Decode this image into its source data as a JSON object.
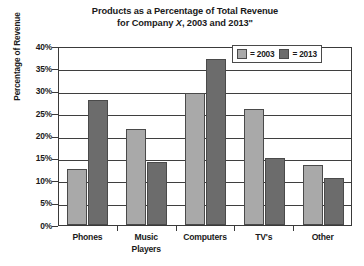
{
  "chart_data": {
    "type": "bar",
    "title": "Products as a Percentage of Total Revenue for Company X, 2003 and 2013\"",
    "title_line1": "Products as a Percentage of Total Revenue",
    "title_line2_pre": "for Company ",
    "title_line2_italic": "X",
    "title_line2_post": ", 2003 and 2013\"",
    "xlabel": "",
    "ylabel": "Percentage of Revenue",
    "ylim": [
      0,
      40
    ],
    "ytick_step": 5,
    "ytick_labels": [
      "40%",
      "35%",
      "30%",
      "25%",
      "20%",
      "15%",
      "10%",
      "5%",
      "0%"
    ],
    "ytick_values": [
      40,
      35,
      30,
      25,
      20,
      15,
      10,
      5,
      0
    ],
    "grid": true,
    "legend_position": "top-right",
    "categories": [
      "Phones",
      "Music Players",
      "Computers",
      "TV's",
      "Other"
    ],
    "category_labels": [
      {
        "line1": "Phones",
        "line2": ""
      },
      {
        "line1": "Music",
        "line2": "Players"
      },
      {
        "line1": "Computers",
        "line2": ""
      },
      {
        "line1": "TV's",
        "line2": ""
      },
      {
        "line1": "Other",
        "line2": ""
      }
    ],
    "series": [
      {
        "name": "2003",
        "legend_label": "= 2003",
        "color": "#a9a9a9",
        "values": [
          12.5,
          21.5,
          29.5,
          26.0,
          13.5
        ]
      },
      {
        "name": "2013",
        "legend_label": "= 2013",
        "color": "#6c6c6c",
        "values": [
          28.0,
          14.0,
          37.0,
          15.0,
          10.5
        ]
      }
    ]
  },
  "colors": {
    "series_2003": "#a9a9a9",
    "series_2013": "#6c6c6c",
    "axis": "#3a3a3a",
    "background": "#ffffff",
    "text": "#1a1a1a"
  }
}
